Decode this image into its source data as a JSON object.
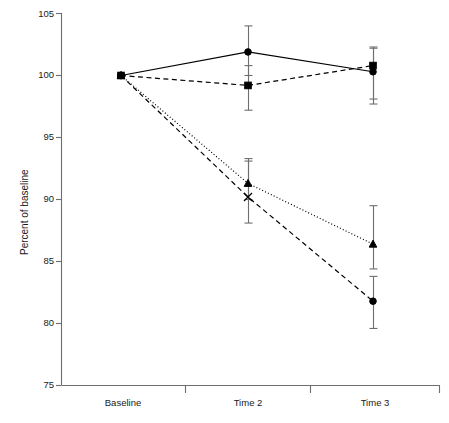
{
  "chart_data": {
    "type": "line",
    "title": "",
    "xlabel": "",
    "ylabel": "Percent of baseline",
    "categories": [
      "Baseline",
      "Time 2",
      "Time 3"
    ],
    "ylim": [
      75,
      105
    ],
    "yticks": [
      75,
      80,
      85,
      90,
      95,
      100,
      105
    ],
    "ytick_labels": [
      "75",
      "80",
      "85",
      "90",
      "95",
      "100",
      "105"
    ],
    "grid": false,
    "legend": "none",
    "series": [
      {
        "name": "series-solid-circle",
        "marker": "circle",
        "line_style": "solid",
        "values": [
          100.0,
          101.9,
          100.3
        ],
        "err_low": [
          0.0,
          1.9,
          2.6
        ],
        "err_high": [
          0.0,
          2.1,
          2.0
        ]
      },
      {
        "name": "series-dashed-square",
        "marker": "square",
        "line_style": "dashed",
        "values": [
          100.0,
          99.2,
          100.8
        ],
        "err_low": [
          0.0,
          2.0,
          2.7
        ],
        "err_high": [
          0.0,
          1.6,
          1.4
        ]
      },
      {
        "name": "series-dotted-triangle",
        "marker": "triangle",
        "line_style": "dotted",
        "values": [
          100.0,
          91.3,
          86.4
        ],
        "err_low": [
          0.0,
          1.3,
          2.0
        ],
        "err_high": [
          0.0,
          1.8,
          3.1
        ]
      },
      {
        "name": "series-dashed-x",
        "marker": "x",
        "line_style": "dashed",
        "values": [
          100.0,
          90.2,
          81.8
        ],
        "err_low": [
          0.0,
          2.1,
          2.2
        ],
        "err_high": [
          0.0,
          3.1,
          2.0
        ]
      }
    ]
  },
  "axes": {
    "y_title": "Percent of baseline",
    "y_labels": [
      "105",
      "100",
      "95",
      "90",
      "85",
      "80",
      "75"
    ],
    "x_labels": [
      "Baseline",
      "Time 2",
      "Time 3"
    ]
  },
  "colors": {
    "line": "#000000",
    "axis": "#6e6e6e",
    "text": "#1a1a1a",
    "background": "#ffffff"
  }
}
